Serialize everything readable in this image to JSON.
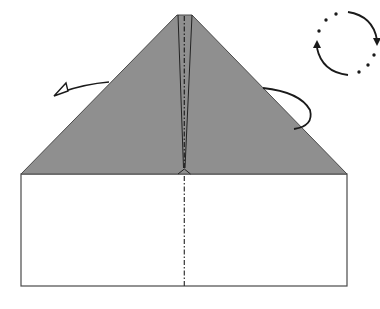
{
  "diagram": {
    "type": "origami-step",
    "colors": {
      "background": "#ffffff",
      "paper_colored_side": "#8f8f8f",
      "paper_white_side": "#ffffff",
      "lines": "#333333",
      "arrows": "#1a1a1a"
    },
    "elements": {
      "colored_triangle_flap": "folded-down top flap (colored side)",
      "white_rectangle": "lower white section of paper",
      "center_crease": "dash-dot valley fold line along vertical center",
      "left_arrow": "fold-behind arrow (hollow head) pointing left",
      "right_arrow": "curved arrow indicating fold behind on right",
      "rotate_symbol": "circular dotted arrows indicating rotate/turn over"
    }
  }
}
